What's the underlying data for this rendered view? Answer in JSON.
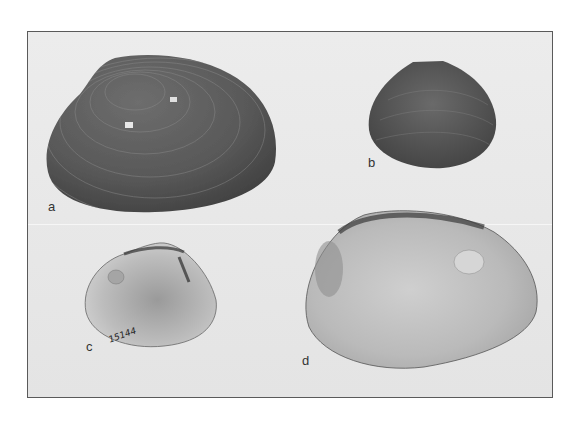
{
  "figure": {
    "panels": [
      {
        "label": "a",
        "view": "exterior",
        "tone": "dark"
      },
      {
        "label": "b",
        "view": "exterior",
        "tone": "dark"
      },
      {
        "label": "c",
        "view": "interior",
        "tone": "light",
        "specimen_number": "15144"
      },
      {
        "label": "d",
        "view": "interior",
        "tone": "light"
      }
    ]
  }
}
